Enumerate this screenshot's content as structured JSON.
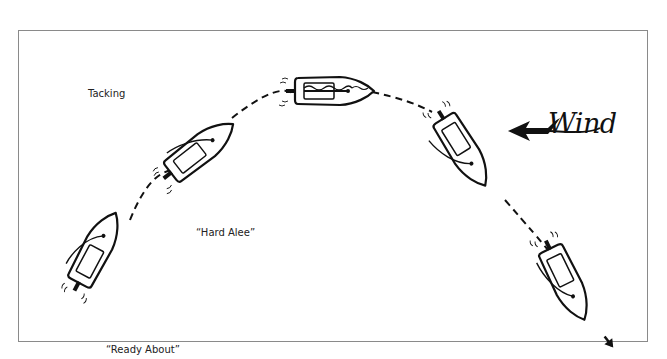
{
  "diagram": {
    "title": "Tacking",
    "wind_label": "Wind",
    "commands": [
      {
        "id": "ready-about",
        "label": "“Ready About”"
      },
      {
        "id": "hard-alee",
        "label": "“Hard Alee”"
      }
    ],
    "boats": [
      {
        "id": "boat-1",
        "stage": "Ready About",
        "cx": 96,
        "cy": 250,
        "rotation": -62
      },
      {
        "id": "boat-2",
        "stage": "Hard Alee",
        "cx": 200,
        "cy": 150,
        "rotation": -38
      },
      {
        "id": "boat-3",
        "stage": "Head to wind",
        "cx": 332,
        "cy": 91,
        "rotation": 0
      },
      {
        "id": "boat-4",
        "stage": "New tack",
        "cx": 463,
        "cy": 150,
        "rotation": 58
      },
      {
        "id": "boat-5",
        "stage": "Underway on new tack",
        "cx": 570,
        "cy": 288,
        "rotation": 64
      }
    ],
    "colors": {
      "ink": "#111111",
      "frame": "#8a8a8a",
      "background": "#ffffff"
    }
  }
}
